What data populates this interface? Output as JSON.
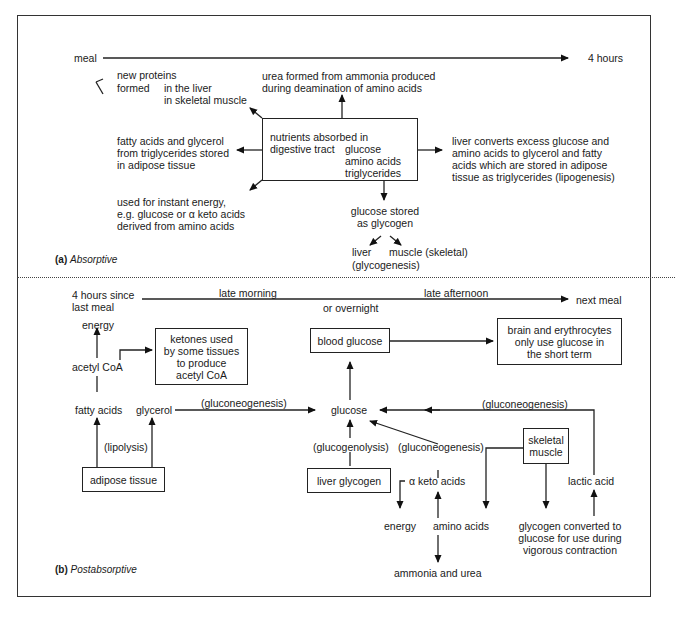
{
  "panel_a": {
    "label_letter": "(a)",
    "label_name": "Absorptive",
    "timeline": {
      "start": "meal",
      "end": "4 hours"
    },
    "center_box": {
      "line1": "nutrients absorbed in",
      "line2": "digestive tract",
      "items": [
        "glucose",
        "amino acids",
        "triglycerides"
      ]
    },
    "new_proteins": {
      "line1": "new proteins",
      "line2": "formed",
      "branches": [
        "in the liver",
        "in skeletal muscle"
      ]
    },
    "urea": "urea formed from ammonia produced\nduring deamination of amino acids",
    "fatty_acids": "fatty acids and glycerol\nfrom triglycerides stored\nin adipose tissue",
    "instant_energy": "used for instant energy,\ne.g. glucose or α keto acids\nderived from amino acids",
    "liver_converts": "liver converts excess glucose and\namino acids to glycerol and fatty\nacids which are stored in adipose\ntissue as triglycerides (lipogenesis)",
    "glucose_stored": "glucose stored\nas glycogen",
    "liver": "liver",
    "glycogenesis": "(glycogenesis)",
    "muscle": "muscle (skeletal)"
  },
  "panel_b": {
    "label_letter": "(b)",
    "label_name": "Postabsorptive",
    "timeline": {
      "start": "4 hours since\nlast meal",
      "above_left": "late morning",
      "below_mid": "or overnight",
      "above_right": "late afternoon",
      "end": "next meal"
    },
    "energy_top": "energy",
    "acetyl_coa": "acetyl CoA",
    "ketones_box": "ketones used\nby some tissues\nto produce\nacetyl CoA",
    "blood_glucose_box": "blood glucose",
    "brain_box": "brain and erythrocytes\nonly use glucose in\nthe short term",
    "fatty_acids": "fatty acids",
    "glycerol": "glycerol",
    "gluconeogenesis_left": "(gluconeogenesis)",
    "glucose": "glucose",
    "gluconeogenesis_right": "(gluconeogenesis)",
    "lipolysis": "(lipolysis)",
    "adipose_box": "adipose tissue",
    "glucogenolysis": "(glucogenolysis)",
    "gluconeogenesis_mid": "(gluconeogenesis)",
    "liver_glycogen_box": "liver glycogen",
    "skeletal_muscle_box": "skeletal\nmuscle",
    "alpha_keto": "α keto acids",
    "energy_bottom": "energy",
    "amino_acids": "amino acids",
    "ammonia_urea": "ammonia and urea",
    "lactic_acid": "lactic acid",
    "glycogen_converted": "glycogen converted to\nglucose for use during\nvigorous contraction"
  }
}
